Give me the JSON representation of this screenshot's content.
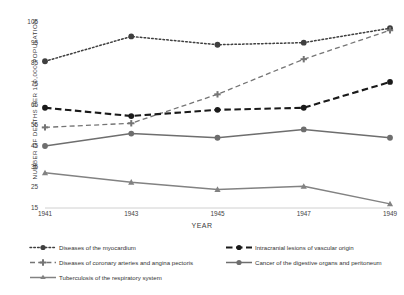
{
  "chart_data": {
    "type": "line",
    "title": "",
    "xlabel": "YEAR",
    "ylabel": "NUMBER OF DEATHS PER 100,000 POPULATION",
    "x": [
      1941,
      1943,
      1945,
      1947,
      1949
    ],
    "categories": [
      "1941",
      "1943",
      "1945",
      "1947",
      "1949"
    ],
    "xlim": [
      1941,
      1949
    ],
    "ylim": [
      15,
      105
    ],
    "yticks": [
      105,
      95,
      85,
      75,
      65,
      55,
      45,
      35,
      25,
      15
    ],
    "xticks": [
      "1941",
      "1943",
      "1945",
      "1947",
      "1949"
    ],
    "grid": false,
    "legend_position": "bottom",
    "series": [
      {
        "name": "Diseases of the myocardium",
        "values": [
          86,
          98,
          94,
          95,
          102
        ],
        "color": "#3f3f3f",
        "linestyle": "dotted",
        "marker": "circle"
      },
      {
        "name": "Diseases of coronary arteries and angina pectoris",
        "values": [
          54,
          56,
          70,
          87,
          101
        ],
        "color": "#757575",
        "linestyle": "dashed",
        "marker": "plus"
      },
      {
        "name": "Intracranial lesions of vascular origin",
        "values": [
          63.5,
          59.5,
          62.5,
          63.5,
          76
        ],
        "color": "#1a1a1a",
        "linestyle": "dashed-bold",
        "marker": "circle"
      },
      {
        "name": "Cancer of the digestive organs and peritoneum",
        "values": [
          45,
          51,
          49,
          53,
          49
        ],
        "color": "#6e6e6e",
        "linestyle": "solid",
        "marker": "circle"
      },
      {
        "name": "Tuberculosis of the respiratory system",
        "values": [
          32,
          27.5,
          24,
          25.5,
          17
        ],
        "color": "#828282",
        "linestyle": "solid",
        "marker": "triangle"
      }
    ]
  },
  "axis": {
    "y_title": "NUMBER OF DEATHS PER 100,000 POPULATION",
    "x_title": "YEAR"
  },
  "legend": {
    "row1_left": "Diseases of the myocardium",
    "row1_right": "Intracranial lesions of vascular origin",
    "row2_left": "Diseases of coronary arteries and angina pectoris",
    "row2_right": "Cancer of the digestive organs and peritoneum",
    "row3_left": "Tuberculosis of the respiratory system"
  }
}
